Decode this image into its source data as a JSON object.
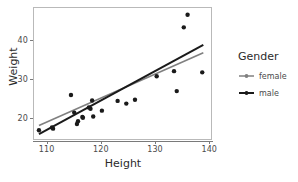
{
  "chart_data": {
    "type": "scatter",
    "title": "",
    "xlabel": "Height",
    "ylabel": "Weight",
    "xlim": [
      107.5,
      140.5
    ],
    "ylim": [
      14.5,
      48.5
    ],
    "xticks": [
      110,
      120,
      130,
      140
    ],
    "yticks": [
      20,
      30,
      40
    ],
    "grid": false,
    "legend": {
      "title": "Gender",
      "position": "right",
      "entries": [
        {
          "label": "female",
          "color": "#808080",
          "key": "line-point"
        },
        {
          "label": "male",
          "color": "#1a1a1a",
          "key": "line-point"
        }
      ]
    },
    "points": [
      {
        "x": 108.6,
        "y": 17.0
      },
      {
        "x": 111.0,
        "y": 17.7
      },
      {
        "x": 111.2,
        "y": 17.4
      },
      {
        "x": 114.5,
        "y": 26.0
      },
      {
        "x": 115.1,
        "y": 21.5
      },
      {
        "x": 115.6,
        "y": 18.6
      },
      {
        "x": 115.8,
        "y": 19.3
      },
      {
        "x": 116.6,
        "y": 20.4
      },
      {
        "x": 116.7,
        "y": 20.2
      },
      {
        "x": 117.8,
        "y": 22.8
      },
      {
        "x": 118.1,
        "y": 22.5
      },
      {
        "x": 118.4,
        "y": 24.6
      },
      {
        "x": 118.6,
        "y": 20.5
      },
      {
        "x": 120.2,
        "y": 22.0
      },
      {
        "x": 123.1,
        "y": 24.5
      },
      {
        "x": 124.7,
        "y": 23.8
      },
      {
        "x": 126.3,
        "y": 24.8
      },
      {
        "x": 130.3,
        "y": 30.8
      },
      {
        "x": 133.5,
        "y": 32.1
      },
      {
        "x": 134.0,
        "y": 27.0
      },
      {
        "x": 135.3,
        "y": 43.3
      },
      {
        "x": 136.0,
        "y": 46.5
      },
      {
        "x": 138.7,
        "y": 31.8
      }
    ],
    "fit_lines": [
      {
        "name": "female",
        "color": "#808080",
        "width": 1.6,
        "x0": 108.6,
        "y0": 18.2,
        "x1": 138.9,
        "y1": 36.8
      },
      {
        "name": "male",
        "color": "#1a1a1a",
        "width": 2.0,
        "x0": 108.6,
        "y0": 16.0,
        "x1": 138.9,
        "y1": 38.8
      }
    ],
    "point_color": "#1a1a1a",
    "point_size": 2.2,
    "panel_border_color": "#b9b9b9",
    "axis_color": "#7a7a7a",
    "background": "#ffffff"
  }
}
